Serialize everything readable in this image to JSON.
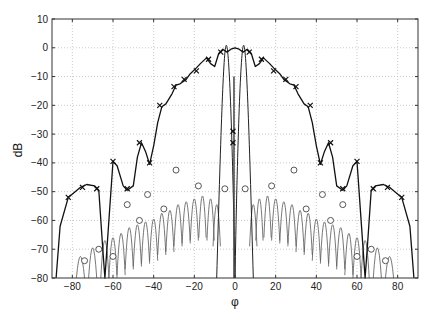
{
  "chart_data": {
    "type": "line",
    "title": "",
    "xlabel": "φ",
    "ylabel": "dB",
    "xlim": [
      -90,
      90
    ],
    "ylim": [
      -80,
      10
    ],
    "xticks": [
      -80,
      -60,
      -40,
      -20,
      0,
      20,
      40,
      60,
      80
    ],
    "yticks": [
      10,
      0,
      -10,
      -20,
      -30,
      -40,
      -50,
      -60,
      -70,
      -80
    ],
    "grid": true,
    "legend": null,
    "series": [
      {
        "name": "pattern-envelope (x markers)",
        "style": "thick solid black, x markers",
        "points": [
          [
            -88,
            -80
          ],
          [
            -86,
            -62
          ],
          [
            -82,
            -52
          ],
          [
            -76,
            -48.5
          ],
          [
            -73,
            -47.5
          ],
          [
            -69,
            -48
          ],
          [
            -67,
            -49.5
          ],
          [
            -65,
            -70
          ],
          [
            -64,
            -80
          ],
          [
            -62,
            -60
          ],
          [
            -60,
            -39.5
          ],
          [
            -58,
            -41
          ],
          [
            -55,
            -48
          ],
          [
            -53,
            -49.5
          ],
          [
            -50,
            -48
          ],
          [
            -48,
            -38
          ],
          [
            -46,
            -33
          ],
          [
            -44,
            -36
          ],
          [
            -42,
            -40.5
          ],
          [
            -40,
            -34
          ],
          [
            -38,
            -26
          ],
          [
            -36,
            -20.5
          ],
          [
            -34,
            -19.5
          ],
          [
            -31,
            -16
          ],
          [
            -29,
            -13
          ],
          [
            -27,
            -12.5
          ],
          [
            -24,
            -11
          ],
          [
            -22,
            -9
          ],
          [
            -19,
            -7
          ],
          [
            -17,
            -5.5
          ],
          [
            -14,
            -3.5
          ],
          [
            -12,
            -5.5
          ],
          [
            -10,
            -6.5
          ],
          [
            -8,
            -2
          ],
          [
            -6,
            -0.5
          ],
          [
            -4,
            -1.5
          ],
          [
            -2,
            -0.5
          ],
          [
            0,
            0
          ],
          [
            2,
            -0.5
          ],
          [
            4,
            -1.5
          ],
          [
            6,
            -0.5
          ],
          [
            8,
            -2
          ],
          [
            10,
            -6.5
          ],
          [
            12,
            -5.5
          ],
          [
            14,
            -3.5
          ],
          [
            17,
            -5.5
          ],
          [
            19,
            -7
          ],
          [
            22,
            -9
          ],
          [
            24,
            -11
          ],
          [
            27,
            -12.5
          ],
          [
            29,
            -13
          ],
          [
            31,
            -16
          ],
          [
            34,
            -19.5
          ],
          [
            36,
            -20.5
          ],
          [
            38,
            -26
          ],
          [
            40,
            -34
          ],
          [
            42,
            -40.5
          ],
          [
            44,
            -36
          ],
          [
            46,
            -33
          ],
          [
            48,
            -38
          ],
          [
            50,
            -48
          ],
          [
            53,
            -49.5
          ],
          [
            55,
            -48
          ],
          [
            58,
            -41
          ],
          [
            60,
            -39.5
          ],
          [
            62,
            -60
          ],
          [
            64,
            -80
          ],
          [
            65,
            -70
          ],
          [
            67,
            -49.5
          ],
          [
            69,
            -48
          ],
          [
            73,
            -47.5
          ],
          [
            76,
            -48.5
          ],
          [
            82,
            -52
          ],
          [
            86,
            -62
          ],
          [
            88,
            -80
          ]
        ],
        "markers_x": [
          [
            -82,
            -52
          ],
          [
            -75,
            -48.5
          ],
          [
            -68,
            -49
          ],
          [
            -60,
            -39.5
          ],
          [
            -53,
            -49
          ],
          [
            -47,
            -33
          ],
          [
            -42,
            -40
          ],
          [
            -37,
            -20
          ],
          [
            -30,
            -13.5
          ],
          [
            -25,
            -11
          ],
          [
            -19,
            -8
          ],
          [
            -13,
            -4
          ],
          [
            -7,
            -1.5
          ],
          [
            -1,
            -29
          ],
          [
            -1,
            -33
          ],
          [
            7,
            -1.5
          ],
          [
            13,
            -4
          ],
          [
            19,
            -8
          ],
          [
            25,
            -11
          ],
          [
            30,
            -13.5
          ],
          [
            37,
            -20
          ],
          [
            42,
            -40
          ],
          [
            47,
            -33
          ],
          [
            53,
            -49
          ],
          [
            60,
            -39.5
          ],
          [
            68,
            -49
          ],
          [
            75,
            -48.5
          ],
          [
            82,
            -52
          ]
        ]
      },
      {
        "name": "main-beam (difference pattern)",
        "style": "thin solid black",
        "peaks": [
          [
            -4,
            0.5
          ],
          [
            4,
            0.5
          ]
        ],
        "null": [
          0,
          -80
        ]
      },
      {
        "name": "sidelobes (o markers)",
        "style": "thin gray solid, o markers",
        "sidelobe_peak_levels": [
          [
            -76,
            -72
          ],
          [
            -70,
            -66
          ],
          [
            -64,
            -61
          ],
          [
            -60,
            -59
          ],
          [
            -56,
            -57
          ],
          [
            -52,
            -55
          ],
          [
            -48,
            -54
          ],
          [
            -44,
            -53
          ],
          [
            -40,
            -52
          ],
          [
            -36,
            -50
          ],
          [
            -32,
            -49
          ],
          [
            -28,
            -47
          ],
          [
            -24,
            -46
          ],
          [
            -20,
            -45
          ],
          [
            -16,
            -44
          ],
          [
            -12,
            -45
          ],
          [
            -9,
            -47
          ],
          [
            9,
            -47
          ],
          [
            12,
            -45
          ],
          [
            16,
            -44
          ],
          [
            20,
            -45
          ],
          [
            24,
            -46
          ],
          [
            28,
            -47
          ],
          [
            32,
            -49
          ],
          [
            36,
            -50
          ],
          [
            40,
            -52
          ],
          [
            44,
            -53
          ],
          [
            48,
            -54
          ],
          [
            52,
            -55
          ],
          [
            56,
            -57
          ],
          [
            60,
            -59
          ],
          [
            64,
            -61
          ],
          [
            70,
            -66
          ],
          [
            76,
            -72
          ]
        ],
        "markers_o": [
          [
            -74,
            -74
          ],
          [
            -67,
            -70
          ],
          [
            -60,
            -72.5
          ],
          [
            -53,
            -54.5
          ],
          [
            -47,
            -60
          ],
          [
            -43,
            -51
          ],
          [
            -35,
            -56
          ],
          [
            -29,
            -42.5
          ],
          [
            -18,
            -48
          ],
          [
            -5,
            -49
          ],
          [
            5,
            -49
          ],
          [
            18,
            -48
          ],
          [
            29,
            -42.5
          ],
          [
            35,
            -56
          ],
          [
            43,
            -51
          ],
          [
            47,
            -60
          ],
          [
            53,
            -54.5
          ],
          [
            60,
            -72.5
          ],
          [
            67,
            -70
          ],
          [
            74,
            -74
          ]
        ]
      }
    ]
  }
}
